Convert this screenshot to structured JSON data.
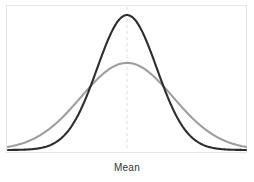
{
  "figure": {
    "background_color": "#ffffff",
    "width": 254,
    "height": 182,
    "axis_label": "Mean",
    "axis_label_color": "#333333",
    "frame_color": "#e6e6e6"
  },
  "chart_data": {
    "type": "line",
    "title": "",
    "subtitle": "",
    "xlabel": "Mean",
    "ylabel": "",
    "grid": false,
    "legend_position": "none",
    "xlim": [
      -4,
      4
    ],
    "ylim": [
      0,
      0.42
    ],
    "x": [
      -4,
      -3.75,
      -3.5,
      -3.25,
      -3,
      -2.75,
      -2.5,
      -2.25,
      -2,
      -1.75,
      -1.5,
      -1.25,
      -1,
      -0.75,
      -0.5,
      -0.25,
      0,
      0.25,
      0.5,
      0.75,
      1,
      1.25,
      1.5,
      1.75,
      2,
      2.25,
      2.5,
      2.75,
      3,
      3.25,
      3.5,
      3.75,
      4
    ],
    "series": [
      {
        "name": "narrow-distribution",
        "color": "#2d2d2d",
        "line_width": 2.1,
        "mean": 0,
        "sigma": 1.0,
        "peak_value": 0.399,
        "values": [
          0.0001,
          0.0004,
          0.0009,
          0.002,
          0.0044,
          0.0091,
          0.0175,
          0.0317,
          0.054,
          0.0863,
          0.1295,
          0.1826,
          0.242,
          0.3011,
          0.3521,
          0.3867,
          0.3989,
          0.3867,
          0.3521,
          0.3011,
          0.242,
          0.1826,
          0.1295,
          0.0863,
          0.054,
          0.0317,
          0.0175,
          0.0091,
          0.0044,
          0.002,
          0.0009,
          0.0004,
          0.0001
        ]
      },
      {
        "name": "wide-distribution",
        "color": "#9e9e9e",
        "line_width": 2.1,
        "mean": 0,
        "sigma": 1.55,
        "peak_value": 0.257,
        "values": [
          0.0129,
          0.0194,
          0.0281,
          0.0392,
          0.0528,
          0.0685,
          0.0858,
          0.1036,
          0.1208,
          0.1359,
          0.1476,
          0.1547,
          0.1566,
          0.1531,
          0.1446,
          0.1318,
          0.1161,
          0.0987,
          0.081,
          0.0642,
          0.0491,
          0.0363,
          0.0259,
          0.0178,
          0.0118,
          0.0076,
          0.0047,
          0.0028,
          0.0016,
          0.0009,
          0.0005,
          0.0002,
          0.0001
        ]
      }
    ],
    "annotations": [
      {
        "name": "mean-line",
        "type": "vertical-dashed-line",
        "x": 0,
        "color": "#dedede",
        "label": "Mean"
      }
    ]
  }
}
